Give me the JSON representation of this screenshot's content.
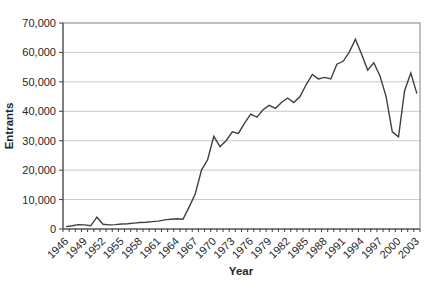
{
  "chart_data": {
    "type": "line",
    "title": "",
    "xlabel": "Year",
    "ylabel": "Entrants",
    "x": [
      1946,
      1947,
      1948,
      1949,
      1950,
      1951,
      1952,
      1953,
      1954,
      1955,
      1956,
      1957,
      1958,
      1959,
      1960,
      1961,
      1962,
      1963,
      1964,
      1965,
      1966,
      1967,
      1968,
      1969,
      1970,
      1971,
      1972,
      1973,
      1974,
      1975,
      1976,
      1977,
      1978,
      1979,
      1980,
      1981,
      1982,
      1983,
      1984,
      1985,
      1986,
      1987,
      1988,
      1989,
      1990,
      1991,
      1992,
      1993,
      1994,
      1995,
      1996,
      1997,
      1998,
      1999,
      2000,
      2001,
      2002,
      2003
    ],
    "values": [
      800,
      1100,
      1500,
      1400,
      1100,
      4000,
      1600,
      1400,
      1500,
      1700,
      1800,
      2000,
      2200,
      2300,
      2500,
      2700,
      3100,
      3300,
      3500,
      3300,
      7500,
      12000,
      20000,
      23500,
      31500,
      28000,
      30000,
      33000,
      32500,
      36000,
      39000,
      38000,
      40500,
      42000,
      41000,
      43000,
      44500,
      43000,
      45000,
      49000,
      52500,
      51000,
      51500,
      51000,
      56000,
      57000,
      60000,
      64500,
      59500,
      54000,
      56500,
      52000,
      45000,
      33000,
      31300,
      47000,
      53000,
      46000
    ],
    "ylim": [
      0,
      70000
    ],
    "y_tick_step": 10000,
    "y_tick_labels": [
      "0",
      "10,000",
      "20,000",
      "30,000",
      "40,000",
      "50,000",
      "60,000",
      "70,000"
    ],
    "x_label_every": 3,
    "x_tick_labels": [
      "1946",
      "1949",
      "1952",
      "1955",
      "1958",
      "1961",
      "1964",
      "1967",
      "1970",
      "1973",
      "1976",
      "1979",
      "1982",
      "1985",
      "1988",
      "1991",
      "1994",
      "1997",
      "2000",
      "2003"
    ],
    "grid": "horizontal",
    "legend": "none",
    "line_color": "#404040",
    "grid_color": "#c9c9c9",
    "border_color": "#808080",
    "axis_color": "#404040"
  }
}
